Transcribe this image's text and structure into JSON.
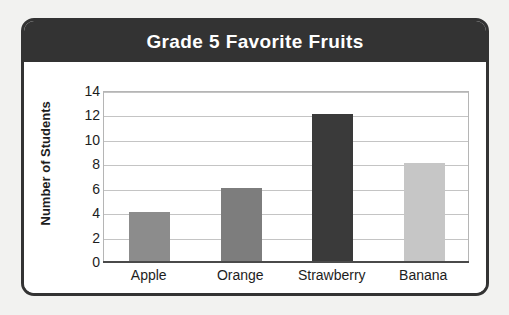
{
  "card": {
    "title": "Grade 5 Favorite Fruits",
    "title_bar_color": "#333333",
    "title_text_color": "#ffffff",
    "border_color": "#333333",
    "background_color": "#ffffff",
    "page_background_color": "#f2f2f0"
  },
  "chart_data": {
    "type": "bar",
    "title": "Grade 5 Favorite Fruits",
    "categories": [
      "Apple",
      "Orange",
      "Strawberry",
      "Banana"
    ],
    "values": [
      4,
      6,
      12,
      8
    ],
    "bar_colors": [
      "#8c8c8c",
      "#7d7d7d",
      "#3a3a3a",
      "#c6c6c6"
    ],
    "xlabel": "",
    "ylabel": "Number of Students",
    "ylim": [
      0,
      14
    ],
    "ytick_step": 2,
    "yticks": [
      0,
      2,
      4,
      6,
      8,
      10,
      12,
      14
    ],
    "ytick_labels": [
      "0",
      "2",
      "4",
      "6",
      "8",
      "10",
      "12",
      "14"
    ],
    "grid": true,
    "grid_axis": "y",
    "grid_color": "#c4c4c4",
    "legend": false,
    "axis_color": "#4a4a4a",
    "plot_background_color": "#ffffff"
  }
}
